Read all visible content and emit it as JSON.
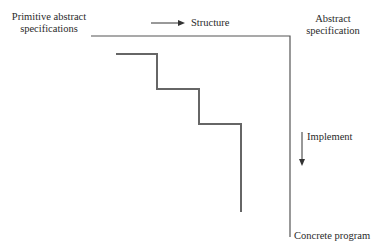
{
  "labels": {
    "primitive": [
      "Primitive abstract",
      "specifications"
    ],
    "abstract": [
      "Abstract",
      "specification"
    ],
    "structure": "Structure",
    "implement": "Implement",
    "concrete": "Concrete program"
  },
  "colors": {
    "line": "#555555",
    "staircase": "#666666",
    "text": "#2a2a2a"
  }
}
